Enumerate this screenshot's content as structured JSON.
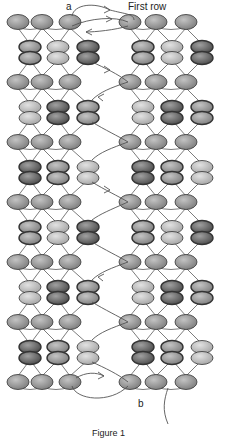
{
  "labels": {
    "a": "a",
    "first_row": "First row",
    "b": "b",
    "caption": "Figure 1"
  },
  "colors": {
    "background": "#ffffff",
    "thread": "#5a5a5a",
    "bead_outline": "#333333",
    "bead_light": "#c8c8c8",
    "bead_mid": "#9a9a9a",
    "bead_dark": "#6e6e6e"
  },
  "structure": {
    "single_rows_y": [
      22,
      82,
      142,
      202,
      262,
      322,
      382
    ],
    "pair_rows_y": [
      52,
      112,
      172,
      232,
      292,
      352
    ],
    "left_single_x": [
      18,
      42,
      70
    ],
    "right_single_x": [
      130,
      156,
      186
    ],
    "left_pair_x": [
      30,
      58,
      88
    ],
    "right_pair_x": [
      143,
      172,
      202
    ]
  }
}
